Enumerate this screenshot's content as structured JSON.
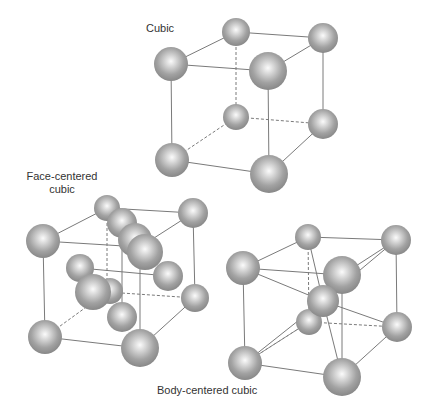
{
  "labels": {
    "cubic": "Cubic",
    "fcc_line1": "Face-centered",
    "fcc_line2": "cubic",
    "bcc": "Body-centered cubic"
  },
  "colors": {
    "sphere_edge": "#8a8a8a",
    "sphere_highlight": "#f7f7f7",
    "line": "#7a7a7a"
  },
  "structures": [
    {
      "name": "Cubic",
      "atoms": 8
    },
    {
      "name": "Face-centered cubic",
      "atoms": 14
    },
    {
      "name": "Body-centered cubic",
      "atoms": 9
    }
  ]
}
